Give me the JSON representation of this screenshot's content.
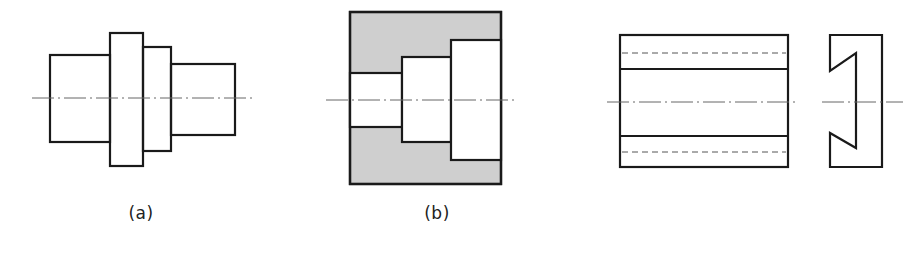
{
  "figures": [
    {
      "id": "a",
      "label": "(a)",
      "label_pos": [
        141,
        213
      ],
      "type": "stepped-shaft-outline",
      "steps": [
        {
          "x": 50,
          "y": 55,
          "w": 60,
          "h": 87
        },
        {
          "x": 110,
          "y": 33,
          "w": 33,
          "h": 133
        },
        {
          "x": 143,
          "y": 47,
          "w": 28,
          "h": 104
        },
        {
          "x": 171,
          "y": 64,
          "w": 64,
          "h": 71
        }
      ],
      "centerline": {
        "x1": 32,
        "x2": 253,
        "y": 98
      }
    },
    {
      "id": "b",
      "label": "(b)",
      "label_pos": [
        437,
        213
      ],
      "type": "stepped-bore-section",
      "section_fill": "#cfcfcf",
      "outer": {
        "x": 350,
        "y": 12,
        "w": 151,
        "h": 172
      },
      "bores": [
        {
          "x": 350,
          "y": 73,
          "w": 52,
          "h": 54
        },
        {
          "x": 402,
          "y": 57,
          "w": 49,
          "h": 85
        },
        {
          "x": 451,
          "y": 40,
          "w": 50,
          "h": 120
        }
      ],
      "centerline": {
        "x1": 326,
        "x2": 515,
        "y": 100
      }
    },
    {
      "id": "c",
      "label": "",
      "type": "dovetail-two-view",
      "front_view": {
        "outer": {
          "x": 620,
          "y": 35,
          "w": 168,
          "h": 132
        },
        "solid_lines_y": [
          69,
          136
        ],
        "hidden_lines_y": [
          53,
          152
        ]
      },
      "side_view": {
        "points": "830,35 882,35 882,167 830,167 830,133 856,148 856,53 830,71"
      },
      "centerlines": [
        {
          "x1": 607,
          "x2": 798,
          "y": 102
        },
        {
          "x1": 822,
          "x2": 903,
          "y": 102
        }
      ]
    }
  ]
}
